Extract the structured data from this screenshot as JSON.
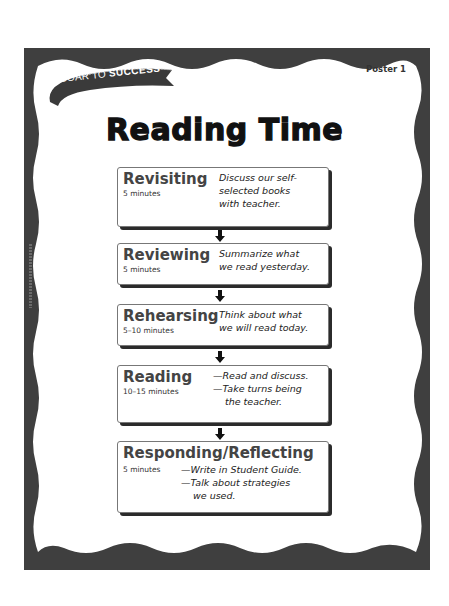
{
  "banner": {
    "prefix": "SOAR TO ",
    "emphasis": "SUCCESS"
  },
  "poster_label": "Poster 1",
  "title": "Reading Time",
  "colors": {
    "frame": "#3f3f3f",
    "text": "#111111",
    "heading": "#444444",
    "shadow": "#2b2b2b"
  },
  "steps": [
    {
      "name": "Revisiting",
      "time": "5 minutes",
      "lines": [
        "Discuss our self-",
        "selected books",
        "with teacher."
      ]
    },
    {
      "name": "Reviewing",
      "time": "5 minutes",
      "lines": [
        "Summarize what",
        "we read yesterday."
      ]
    },
    {
      "name": "Rehearsing",
      "time": "5–10 minutes",
      "lines": [
        "Think about what",
        "we will read today."
      ]
    },
    {
      "name": "Reading",
      "time": "10–15 minutes",
      "lines": [
        "—Read and discuss.",
        "—Take turns being",
        "the teacher."
      ]
    },
    {
      "name": "Responding/Reflecting",
      "time": "5 minutes",
      "lines": [
        "—Write in Student Guide.",
        "—Talk about strategies",
        "we used."
      ]
    }
  ],
  "icons": {
    "arrow": "down-arrow-icon"
  }
}
